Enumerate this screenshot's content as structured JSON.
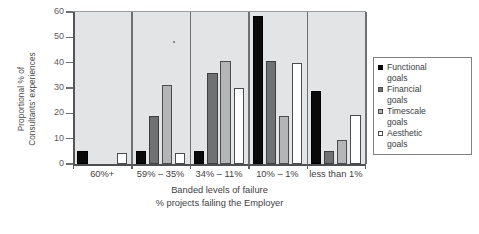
{
  "chart_data": {
    "type": "bar",
    "title": "",
    "xlabel": "Banded levels of failure",
    "xlabel2": "% projects failing the Employer",
    "ylabel": "Proportional % of\nConsultants' experiences",
    "ylim": [
      0,
      60
    ],
    "yticks": [
      0,
      10,
      20,
      30,
      40,
      50,
      60
    ],
    "ytick_labels": [
      "0",
      "10",
      "20",
      "30",
      "40",
      "50",
      "60"
    ],
    "grid": false,
    "legend_position": "right-outside",
    "categories": [
      "60%+",
      "59% – 35%",
      "34% – 11%",
      "10% – 1%",
      "less than 1%"
    ],
    "series": [
      {
        "name": "Functional\ngoals",
        "color": "#0a0a0a",
        "values": [
          5,
          5,
          5,
          58.5,
          29
        ]
      },
      {
        "name": "Financial\ngoals",
        "color": "#6f7173",
        "values": [
          0,
          19,
          36,
          40.5,
          5
        ]
      },
      {
        "name": "Timescale\ngoals",
        "color": "#b3b5b7",
        "values": [
          0,
          31,
          40.5,
          19,
          9.5
        ]
      },
      {
        "name": "Aesthetic\ngoals",
        "color": "#ffffff",
        "values": [
          4.5,
          4.5,
          30,
          40,
          19.5
        ]
      }
    ]
  },
  "legend": {
    "items": [
      {
        "label": "Functional\ngoals"
      },
      {
        "label": "Financial\ngoals"
      },
      {
        "label": "Timescale\ngoals"
      },
      {
        "label": "Aesthetic\ngoals"
      }
    ]
  },
  "colors": {
    "plot_background": "#e2e4e5",
    "axis": "#4d4f51",
    "separator": "#6e7072",
    "text": "#3f4143"
  }
}
